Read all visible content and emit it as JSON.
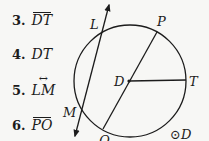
{
  "exercises": [
    {
      "number": "3.",
      "symbol": "DT",
      "notation": "segment"
    },
    {
      "number": "4.",
      "symbol": "DT",
      "notation": "length"
    },
    {
      "number": "5.",
      "symbol": "LM",
      "notation": "line"
    },
    {
      "number": "6.",
      "symbol": "PO",
      "notation": "segment"
    }
  ],
  "figure": {
    "circle_label": "⊙D",
    "points": {
      "L": "L",
      "P": "P",
      "D": "D",
      "T": "T",
      "M": "M",
      "Q": "Q"
    }
  }
}
